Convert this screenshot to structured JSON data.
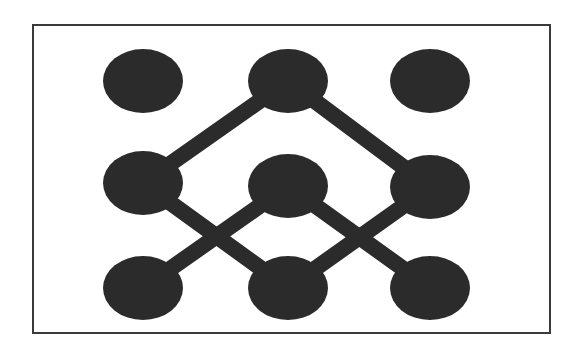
{
  "diagram": {
    "type": "network-graph",
    "colors": {
      "background": "#ffffff",
      "frame": "#3a3a3a",
      "node": "#2b2b2b",
      "edge": "#2b2b2b"
    },
    "frame": {
      "x": 33,
      "y": 25,
      "width": 517,
      "height": 308,
      "stroke_width": 2
    },
    "node_size": {
      "rx": 40,
      "ry": 32
    },
    "edge_width": 16,
    "nodes": [
      {
        "id": "top-left",
        "row": 0,
        "col": 0,
        "cx": 143,
        "cy": 81
      },
      {
        "id": "top-center",
        "row": 0,
        "col": 1,
        "cx": 288,
        "cy": 81
      },
      {
        "id": "top-right",
        "row": 0,
        "col": 2,
        "cx": 430,
        "cy": 81
      },
      {
        "id": "middle-left",
        "row": 1,
        "col": 0,
        "cx": 143,
        "cy": 183
      },
      {
        "id": "middle-center",
        "row": 1,
        "col": 1,
        "cx": 288,
        "cy": 186
      },
      {
        "id": "middle-right",
        "row": 1,
        "col": 2,
        "cx": 430,
        "cy": 187
      },
      {
        "id": "bottom-left",
        "row": 2,
        "col": 0,
        "cx": 143,
        "cy": 288
      },
      {
        "id": "bottom-center",
        "row": 2,
        "col": 1,
        "cx": 288,
        "cy": 288
      },
      {
        "id": "bottom-right",
        "row": 2,
        "col": 2,
        "cx": 430,
        "cy": 288
      }
    ],
    "edges": [
      {
        "from": "top-center",
        "to": "middle-left"
      },
      {
        "from": "top-center",
        "to": "middle-right"
      },
      {
        "from": "middle-left",
        "to": "bottom-center"
      },
      {
        "from": "middle-right",
        "to": "bottom-center"
      },
      {
        "from": "middle-center",
        "to": "bottom-left"
      },
      {
        "from": "middle-center",
        "to": "bottom-right"
      }
    ]
  }
}
